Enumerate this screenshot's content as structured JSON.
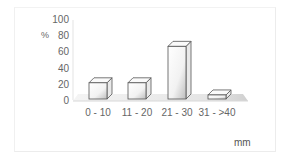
{
  "chart_data": {
    "type": "bar",
    "style": "3d-column",
    "title": "",
    "categories": [
      "0 - 10",
      "11 - 20",
      "21 - 30",
      "31 - >40"
    ],
    "values": [
      20,
      20,
      65,
      5
    ],
    "xlabel": "mm",
    "ylabel": "%",
    "ylim": [
      0,
      100
    ],
    "yticks": [
      "0",
      "20",
      "40",
      "60",
      "80",
      "100"
    ],
    "grid": false,
    "legend": null
  }
}
